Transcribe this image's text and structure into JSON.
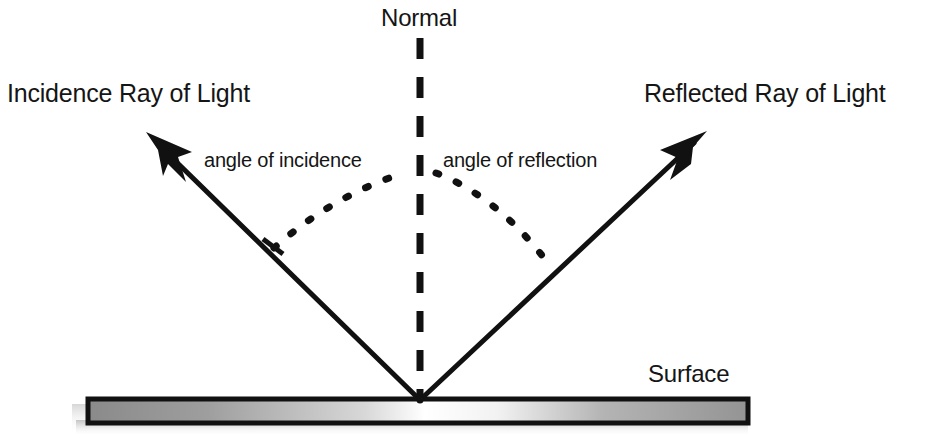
{
  "diagram": {
    "background_color": "#ffffff",
    "stroke_color": "#111111",
    "labels": {
      "normal": "Normal",
      "incidence_ray": "Incidence Ray of Light",
      "reflected_ray": "Reflected Ray of Light",
      "angle_of_incidence": "angle of incidence",
      "angle_of_reflection": "angle of reflection",
      "surface": "Surface"
    },
    "elements": {
      "normal_line": {
        "name": "normal-dashed-line",
        "style": "dashed",
        "x": 420,
        "y_top": 38,
        "y_bottom": 400
      },
      "incident_ray": {
        "name": "incident-ray-arrow",
        "from_x": 148,
        "from_y": 135,
        "to_x": 420,
        "to_y": 400,
        "arrowhead": "start"
      },
      "reflected_ray": {
        "name": "reflected-ray-arrow",
        "from_x": 420,
        "from_y": 400,
        "to_x": 706,
        "to_y": 132,
        "arrowhead": "end"
      },
      "incidence_arc": {
        "name": "angle-of-incidence-arc",
        "style": "dotted",
        "start_x": 272,
        "start_y": 246,
        "end_x": 404,
        "end_y": 172
      },
      "reflection_arc": {
        "name": "angle-of-reflection-arc",
        "style": "dotted",
        "start_x": 436,
        "start_y": 172,
        "end_x": 549,
        "end_y": 268
      },
      "surface_bar": {
        "name": "reflective-surface-bar",
        "x": 88,
        "y": 399,
        "width": 660,
        "height": 23,
        "gradient": [
          "#8f8f8f",
          "#ffffff",
          "#9a9a9a"
        ],
        "border_color": "#111111",
        "shadow": true
      },
      "reflection_point": {
        "name": "point-of-incidence",
        "x": 420,
        "y": 400
      }
    },
    "colors": {
      "ink": "#111111",
      "text": "#151515",
      "paper": "#ffffff",
      "surface_gray_left": "#8f8f8f",
      "surface_gray_right": "#9a9a9a",
      "surface_highlight": "#ffffff"
    }
  }
}
